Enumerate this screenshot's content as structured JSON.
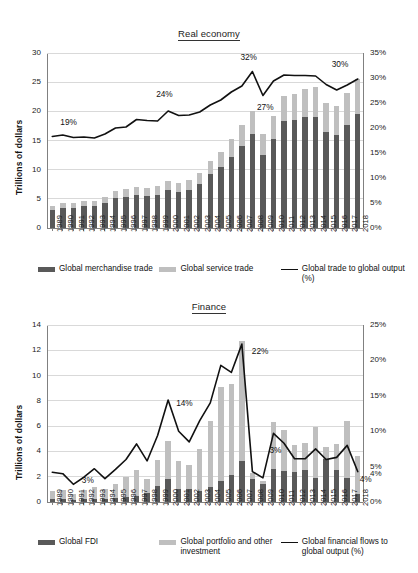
{
  "chart_data": [
    {
      "id": "real-economy",
      "type": "bar",
      "title": "Real economy",
      "xlabel": "",
      "ylabel": "Trillions of dollars",
      "ylim": [
        0,
        30
      ],
      "yticks": [
        0,
        5,
        10,
        15,
        20,
        25,
        30
      ],
      "y2label": "",
      "y2lim": [
        0,
        35
      ],
      "y2ticks": [
        "0%",
        "5%",
        "10%",
        "15%",
        "20%",
        "25%",
        "30%",
        "35%"
      ],
      "grid": true,
      "legend_position": "bottom",
      "stacked": true,
      "categories": [
        "1989",
        "1990",
        "1991",
        "1992",
        "1993",
        "1994",
        "1995",
        "1996",
        "1997",
        "1998",
        "1999",
        "2000",
        "2001",
        "2002",
        "2003",
        "2004",
        "2005",
        "2006",
        "2007",
        "2008",
        "2009",
        "2010",
        "2011",
        "2012",
        "2013",
        "2014",
        "2015",
        "2016",
        "2017",
        "2018"
      ],
      "series": [
        {
          "name": "Global merchandise trade",
          "kind": "bar",
          "color": "#595959",
          "values": [
            3.1,
            3.5,
            3.5,
            3.8,
            3.8,
            4.3,
            5.1,
            5.4,
            5.6,
            5.5,
            5.7,
            6.5,
            6.2,
            6.5,
            7.6,
            9.3,
            10.5,
            12.2,
            14.1,
            16.2,
            12.6,
            15.3,
            18.4,
            18.5,
            19.0,
            19.0,
            16.5,
            16.0,
            17.7,
            19.5
          ]
        },
        {
          "name": "Global service trade",
          "kind": "bar",
          "color": "#bfbfbf",
          "values": [
            0.7,
            0.8,
            0.8,
            0.9,
            0.9,
            1.0,
            1.2,
            1.3,
            1.4,
            1.4,
            1.5,
            1.6,
            1.6,
            1.7,
            1.9,
            2.2,
            2.6,
            3.0,
            3.5,
            3.8,
            3.6,
            3.9,
            4.3,
            4.5,
            4.9,
            5.2,
            5.0,
            5.0,
            5.4,
            6.0
          ]
        },
        {
          "name": "Global trade to global output (%)",
          "kind": "line",
          "color": "#111111",
          "axis": "right",
          "values": [
            18.3,
            18.6,
            18.1,
            18.2,
            18.0,
            18.8,
            20.0,
            20.2,
            21.7,
            21.5,
            21.4,
            23.4,
            22.5,
            22.6,
            23.2,
            24.6,
            25.6,
            27.2,
            28.4,
            31.3,
            26.5,
            29.4,
            30.6,
            30.5,
            30.5,
            30.4,
            28.7,
            27.6,
            28.6,
            29.8
          ]
        }
      ],
      "annotations": [
        {
          "text": "19%",
          "category": "1989"
        },
        {
          "text": "24%",
          "category": "2000"
        },
        {
          "text": "32%",
          "category": "2008"
        },
        {
          "text": "27%",
          "category": "2009"
        },
        {
          "text": "30%",
          "category": "2018"
        }
      ]
    },
    {
      "id": "finance",
      "type": "bar",
      "title": "Finance",
      "xlabel": "",
      "ylabel": "Trillions of dollars",
      "ylim": [
        0,
        14
      ],
      "yticks": [
        0,
        2,
        4,
        6,
        8,
        10,
        12,
        14
      ],
      "y2label": "",
      "y2lim": [
        0,
        25
      ],
      "y2ticks": [
        "0%",
        "5%",
        "10%",
        "15%",
        "20%",
        "25%"
      ],
      "grid": true,
      "legend_position": "bottom",
      "stacked": true,
      "categories": [
        "1989",
        "1990",
        "1991",
        "1992",
        "1993",
        "1994",
        "1995",
        "1996",
        "1997",
        "1998",
        "1999",
        "2000",
        "2001",
        "2002",
        "2003",
        "2004",
        "2005",
        "2006",
        "2007",
        "2008",
        "2009",
        "2010",
        "2011",
        "2012",
        "2013",
        "2014",
        "2015",
        "2016",
        "2017",
        "2018"
      ],
      "series": [
        {
          "name": "Global FDI",
          "kind": "bar",
          "color": "#595959",
          "values": [
            0.2,
            0.2,
            0.15,
            0.2,
            0.2,
            0.25,
            0.3,
            0.4,
            0.5,
            0.7,
            1.25,
            1.8,
            1.0,
            1.0,
            0.9,
            1.15,
            1.7,
            2.15,
            3.25,
            1.8,
            1.45,
            2.6,
            2.45,
            2.4,
            2.55,
            1.9,
            3.4,
            2.55,
            1.9,
            0.65
          ]
        },
        {
          "name": "Global portfolio and other investment",
          "kind": "bar",
          "color": "#bfbfbf",
          "values": [
            0.7,
            0.75,
            0.45,
            0.75,
            1.0,
            0.75,
            1.1,
            1.6,
            2.05,
            1.15,
            2.1,
            3.0,
            2.25,
            1.95,
            3.3,
            5.25,
            7.4,
            7.2,
            9.5,
            0.5,
            0.2,
            3.75,
            3.25,
            2.1,
            2.15,
            4.0,
            0.95,
            2.05,
            4.5,
            2.95
          ]
        },
        {
          "name": "Global financial flows to global output (%)",
          "kind": "line",
          "color": "#111111",
          "axis": "right",
          "values": [
            4.2,
            4.0,
            2.5,
            3.5,
            4.7,
            3.3,
            4.6,
            6.0,
            8.2,
            5.8,
            9.4,
            14.4,
            10.0,
            8.5,
            11.5,
            14.0,
            19.3,
            18.3,
            22.3,
            4.3,
            3.4,
            9.7,
            8.3,
            6.1,
            6.1,
            7.5,
            6.0,
            6.3,
            8.0,
            4.3
          ]
        }
      ],
      "annotations": [
        {
          "text": "3%",
          "category": "1992"
        },
        {
          "text": "14%",
          "category": "2000"
        },
        {
          "text": "22%",
          "category": "2007"
        },
        {
          "text": "3%",
          "category": "2010"
        },
        {
          "text": "4%",
          "category": "2018"
        }
      ]
    }
  ],
  "real": {
    "title": "Real economy",
    "ylabel": "Trillions of dollars",
    "yticks": [
      "30",
      "25",
      "20",
      "15",
      "10",
      "5",
      "0"
    ],
    "y2ticks": [
      "35%",
      "30%",
      "25%",
      "20%",
      "15%",
      "10%",
      "5%",
      "0%"
    ],
    "legend": [
      {
        "label": "Global merchandise trade",
        "type": "bar-dark"
      },
      {
        "label": "Global service trade",
        "type": "bar-light"
      },
      {
        "label": "Global trade to global output (%)",
        "type": "line"
      }
    ]
  },
  "finance": {
    "title": "Finance",
    "ylabel": "Trillions of dollars",
    "yticks": [
      "14",
      "12",
      "10",
      "8",
      "6",
      "4",
      "2",
      "0"
    ],
    "y2ticks": [
      "25%",
      "20%",
      "15%",
      "10%",
      "5%",
      "0%"
    ],
    "extra_y2tick": "4%",
    "legend": [
      {
        "label": "Global FDI",
        "type": "bar-dark"
      },
      {
        "label": "Global portfolio and other investment",
        "type": "bar-light"
      },
      {
        "label": "Global financial flows to global output (%)",
        "type": "line"
      }
    ]
  },
  "colors": {
    "dark_bar": "#595959",
    "light_bar": "#bfbfbf",
    "line": "#111111",
    "grid": "#d9d9d9",
    "axis": "#808080"
  }
}
